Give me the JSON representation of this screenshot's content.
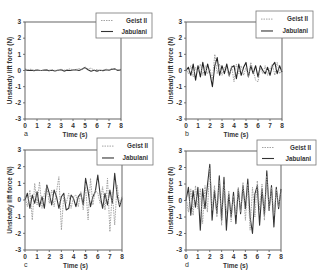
{
  "chart_data": [
    {
      "panel": "a",
      "type": "line",
      "title": "",
      "xlabel": "Time (s)",
      "ylabel": "Unsteady lift force (N)",
      "xlim": [
        0,
        8
      ],
      "ylim": [
        -3,
        3
      ],
      "xticks": [
        0,
        1,
        2,
        3,
        4,
        5,
        6,
        7,
        8
      ],
      "yticks": [
        -3,
        -2,
        -1,
        0,
        1,
        2,
        3
      ],
      "grid": false,
      "legend_position": "top-right (outside, overlapping frame)",
      "legend": [
        "Geist II",
        "Jabulani"
      ],
      "series": [
        {
          "name": "Geist II",
          "style": "dotted",
          "color": "#9a9a9a",
          "x": [
            0,
            0.25,
            0.5,
            0.75,
            1,
            1.25,
            1.5,
            1.75,
            2,
            2.25,
            2.5,
            2.75,
            3,
            3.25,
            3.5,
            3.75,
            4,
            4.25,
            4.5,
            4.75,
            5,
            5.25,
            5.5,
            5.75,
            6,
            6.25,
            6.5,
            6.75,
            7,
            7.25,
            7.5,
            7.75,
            8
          ],
          "values": [
            0.1,
            0.05,
            0.08,
            0.02,
            0.06,
            0.0,
            0.04,
            0.07,
            0.02,
            0.05,
            0.0,
            0.03,
            0.08,
            0.02,
            0.05,
            0.1,
            0.04,
            0.06,
            0.12,
            0.08,
            0.22,
            0.1,
            0.15,
            0.02,
            0.06,
            0.0,
            0.04,
            0.08,
            0.05,
            0.12,
            0.06,
            0.04,
            0.08
          ]
        },
        {
          "name": "Jabulani",
          "style": "solid",
          "color": "#333333",
          "x": [
            0,
            0.25,
            0.5,
            0.75,
            1,
            1.25,
            1.5,
            1.75,
            2,
            2.25,
            2.5,
            2.75,
            3,
            3.25,
            3.5,
            3.75,
            4,
            4.25,
            4.5,
            4.75,
            5,
            5.25,
            5.5,
            5.75,
            6,
            6.25,
            6.5,
            6.75,
            7,
            7.25,
            7.5,
            7.75,
            8
          ],
          "values": [
            0.05,
            0.0,
            0.02,
            -0.02,
            0.03,
            0.0,
            0.01,
            0.04,
            -0.02,
            0.02,
            -0.03,
            0.01,
            0.05,
            -0.04,
            0.02,
            0.0,
            0.03,
            0.05,
            0.0,
            0.08,
            0.18,
            0.05,
            -0.05,
            0.02,
            -0.04,
            0.01,
            -0.02,
            0.05,
            0.02,
            0.08,
            0.1,
            0.0,
            0.05
          ]
        }
      ]
    },
    {
      "panel": "b",
      "type": "line",
      "title": "",
      "xlabel": "Time (s)",
      "ylabel": "Unsteady lift force (N)",
      "xlim": [
        0,
        8
      ],
      "ylim": [
        -3,
        3
      ],
      "xticks": [
        0,
        1,
        2,
        3,
        4,
        5,
        6,
        7,
        8
      ],
      "yticks": [
        -3,
        -2,
        -1,
        0,
        1,
        2,
        3
      ],
      "grid": false,
      "legend_position": "top-right (outside, overlapping frame)",
      "legend": [
        "Geist II",
        "Jabulani"
      ],
      "series": [
        {
          "name": "Geist II",
          "style": "dotted",
          "color": "#9a9a9a",
          "x": [
            0,
            0.2,
            0.4,
            0.6,
            0.8,
            1,
            1.2,
            1.4,
            1.6,
            1.8,
            2,
            2.2,
            2.4,
            2.6,
            2.8,
            3,
            3.2,
            3.4,
            3.6,
            3.8,
            4,
            4.2,
            4.4,
            4.6,
            4.8,
            5,
            5.2,
            5.4,
            5.6,
            5.8,
            6,
            6.2,
            6.4,
            6.6,
            6.8,
            7,
            7.2,
            7.4,
            7.6,
            7.8,
            8
          ],
          "values": [
            0.1,
            -0.2,
            0.3,
            -0.4,
            0.2,
            -0.1,
            0.4,
            -0.3,
            0.3,
            -0.2,
            0.1,
            -0.6,
            1.0,
            -0.2,
            0.4,
            -0.3,
            0.2,
            0.1,
            -0.4,
            0.3,
            -0.7,
            0.4,
            -0.2,
            0.3,
            -0.3,
            0.2,
            -0.4,
            0.5,
            0.0,
            -0.6,
            -0.7,
            0.2,
            -0.2,
            0.3,
            -0.3,
            0.1,
            0.4,
            -0.3,
            0.5,
            -0.2,
            0.1
          ]
        },
        {
          "name": "Jabulani",
          "style": "solid",
          "color": "#222222",
          "x": [
            0,
            0.2,
            0.4,
            0.6,
            0.8,
            1,
            1.2,
            1.4,
            1.6,
            1.8,
            2,
            2.2,
            2.4,
            2.6,
            2.8,
            3,
            3.2,
            3.4,
            3.6,
            3.8,
            4,
            4.2,
            4.4,
            4.6,
            4.8,
            5,
            5.2,
            5.4,
            5.6,
            5.8,
            6,
            6.2,
            6.4,
            6.6,
            6.8,
            7,
            7.2,
            7.4,
            7.6,
            7.8,
            8
          ],
          "values": [
            0.0,
            0.2,
            -0.3,
            0.4,
            -0.6,
            0.3,
            -0.4,
            0.5,
            -0.3,
            0.4,
            -0.2,
            -1.0,
            0.3,
            0.8,
            -0.3,
            0.3,
            -0.2,
            0.4,
            -0.3,
            0.2,
            0.3,
            -0.5,
            0.4,
            -0.3,
            0.2,
            0.5,
            -0.4,
            0.3,
            -0.2,
            0.3,
            -0.4,
            0.3,
            0.0,
            -0.2,
            0.2,
            -0.3,
            0.3,
            0.5,
            -0.2,
            0.3,
            -0.1
          ]
        }
      ]
    },
    {
      "panel": "c",
      "type": "line",
      "title": "",
      "xlabel": "Time (s)",
      "ylabel": "Unsteady lift force (N)",
      "xlim": [
        0,
        8
      ],
      "ylim": [
        -3,
        3
      ],
      "xticks": [
        0,
        1,
        2,
        3,
        4,
        5,
        6,
        7,
        8
      ],
      "yticks": [
        -3,
        -2,
        -1,
        0,
        1,
        2,
        3
      ],
      "grid": false,
      "legend_position": "top-right (outside, overlapping frame)",
      "legend": [
        "Geist II",
        "Jabulani"
      ],
      "series": [
        {
          "name": "Geist II",
          "style": "dotted",
          "color": "#9a9a9a",
          "x": [
            0,
            0.2,
            0.4,
            0.6,
            0.8,
            1,
            1.2,
            1.4,
            1.6,
            1.8,
            2,
            2.2,
            2.4,
            2.6,
            2.8,
            3,
            3.2,
            3.4,
            3.6,
            3.8,
            4,
            4.2,
            4.4,
            4.6,
            4.8,
            5,
            5.2,
            5.4,
            5.6,
            5.8,
            6,
            6.2,
            6.4,
            6.6,
            6.8,
            7,
            7.2,
            7.4,
            7.6,
            7.8,
            8
          ],
          "values": [
            0.2,
            -0.4,
            0.6,
            -1.2,
            1.0,
            -0.3,
            1.1,
            -0.5,
            0.4,
            0.8,
            -0.2,
            0.6,
            -0.4,
            0.5,
            1.4,
            -1.8,
            0.3,
            -0.2,
            0.4,
            -0.5,
            0.2,
            0.3,
            -0.4,
            0.5,
            -0.6,
            0.8,
            -1.2,
            1.3,
            -0.3,
            0.6,
            0.4,
            -0.2,
            0.8,
            -0.6,
            1.3,
            -1.9,
            0.5,
            -1.5,
            0.9,
            -0.3,
            0.2
          ]
        },
        {
          "name": "Jabulani",
          "style": "solid",
          "color": "#333333",
          "x": [
            0,
            0.2,
            0.4,
            0.6,
            0.8,
            1,
            1.2,
            1.4,
            1.6,
            1.8,
            2,
            2.2,
            2.4,
            2.6,
            2.8,
            3,
            3.2,
            3.4,
            3.6,
            3.8,
            4,
            4.2,
            4.4,
            4.6,
            4.8,
            5,
            5.2,
            5.4,
            5.6,
            5.8,
            6,
            6.2,
            6.4,
            6.6,
            6.8,
            7,
            7.2,
            7.4,
            7.6,
            7.8,
            8
          ],
          "values": [
            0.0,
            0.4,
            -0.5,
            0.3,
            -0.2,
            0.5,
            -0.4,
            0.2,
            -0.5,
            0.9,
            0.4,
            -0.3,
            0.6,
            0.2,
            -0.5,
            0.2,
            0.4,
            -0.6,
            -0.5,
            0.3,
            0.1,
            -0.4,
            0.2,
            0.4,
            -0.3,
            1.3,
            0.5,
            -0.4,
            0.2,
            0.5,
            1.5,
            0.3,
            -0.5,
            0.4,
            -0.3,
            0.6,
            -0.2,
            1.6,
            0.3,
            -0.4,
            0.1
          ]
        }
      ]
    },
    {
      "panel": "d",
      "type": "line",
      "title": "",
      "xlabel": "Time (s)",
      "ylabel": "Unsteady lift force (N)",
      "xlim": [
        0,
        8
      ],
      "ylim": [
        -3,
        3
      ],
      "xticks": [
        0,
        1,
        2,
        3,
        4,
        5,
        6,
        7,
        8
      ],
      "yticks": [
        -3,
        -2,
        -1,
        0,
        1,
        2,
        3
      ],
      "grid": false,
      "legend_position": "top-right (outside, overlapping frame)",
      "legend": [
        "Geist II",
        "Jabulani"
      ],
      "series": [
        {
          "name": "Geist II",
          "style": "dotted",
          "color": "#9a9a9a",
          "x": [
            0,
            0.2,
            0.4,
            0.6,
            0.8,
            1,
            1.2,
            1.4,
            1.6,
            1.8,
            2,
            2.2,
            2.4,
            2.6,
            2.8,
            3,
            3.2,
            3.4,
            3.6,
            3.8,
            4,
            4.2,
            4.4,
            4.6,
            4.8,
            5,
            5.2,
            5.4,
            5.6,
            5.8,
            6,
            6.2,
            6.4,
            6.6,
            6.8,
            7,
            7.2,
            7.4,
            7.6,
            7.8,
            8
          ],
          "values": [
            0.2,
            -0.7,
            0.7,
            -0.9,
            0.9,
            -0.5,
            0.7,
            -1.4,
            0.9,
            -0.7,
            2.0,
            -0.6,
            0.9,
            -1.0,
            1.2,
            -1.5,
            1.0,
            -0.8,
            0.6,
            -1.3,
            0.3,
            -0.9,
            0.8,
            -0.7,
            1.1,
            -1.2,
            1.0,
            -1.8,
            0.8,
            -1.0,
            1.2,
            -0.6,
            1.0,
            -1.2,
            1.5,
            -0.6,
            0.8,
            -0.9,
            0.7,
            -0.4,
            0.6
          ]
        },
        {
          "name": "Jabulani",
          "style": "solid",
          "color": "#333333",
          "x": [
            0,
            0.2,
            0.4,
            0.6,
            0.8,
            1,
            1.2,
            1.4,
            1.6,
            1.8,
            2,
            2.2,
            2.4,
            2.6,
            2.8,
            3,
            3.2,
            3.4,
            3.6,
            3.8,
            4,
            4.2,
            4.4,
            4.6,
            4.8,
            5,
            5.2,
            5.4,
            5.6,
            5.8,
            6,
            6.2,
            6.4,
            6.6,
            6.8,
            7,
            7.2,
            7.4,
            7.6,
            7.8,
            8
          ],
          "values": [
            0.0,
            0.8,
            -0.9,
            0.6,
            -0.4,
            0.8,
            -1.8,
            0.7,
            -0.5,
            0.9,
            2.2,
            -1.2,
            0.6,
            -0.8,
            1.5,
            -1.2,
            1.4,
            -1.8,
            0.4,
            -1.0,
            0.5,
            -1.4,
            0.7,
            -0.8,
            0.9,
            -0.5,
            1.3,
            -1.0,
            -2.0,
            0.4,
            0.9,
            -1.5,
            0.7,
            -0.9,
            1.8,
            -0.6,
            0.9,
            -1.6,
            0.8,
            -0.5,
            0.7
          ]
        }
      ]
    }
  ],
  "panels": [
    {
      "letter": "a",
      "xlabel": "Time (s)",
      "ylabel": "Unsteady lift force (N)",
      "legend": {
        "item1": "Geist II",
        "item2": "Jabulani"
      }
    },
    {
      "letter": "b",
      "xlabel": "Time (s)",
      "ylabel": "Unsteady lift force (N)",
      "legend": {
        "item1": "Geist II",
        "item2": "Jabulani"
      }
    },
    {
      "letter": "c",
      "xlabel": "Time (s)",
      "ylabel": "Unsteady lift force (N)",
      "legend": {
        "item1": "Geist II",
        "item2": "Jabulani"
      }
    },
    {
      "letter": "d",
      "xlabel": "Time (s)",
      "ylabel": "Unsteady lift force (N)",
      "legend": {
        "item1": "Geist II",
        "item2": "Jabulani"
      }
    }
  ],
  "colors": {
    "axis": "#555555",
    "geist": "#9a9a9a",
    "jabulani": "#333333",
    "legend_border": "#777777"
  }
}
